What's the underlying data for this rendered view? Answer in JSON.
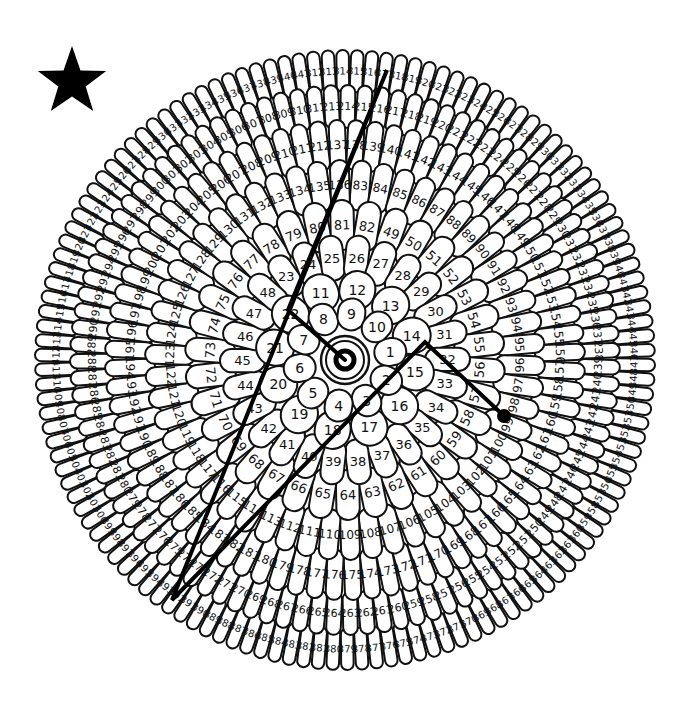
{
  "puzzle": {
    "title": "Numbered flower connect-the-path puzzle",
    "center": {
      "x": 345,
      "y": 360
    },
    "colors": {
      "line": "#000000",
      "outline": "#111111",
      "fill": "#ffffff",
      "background": "#ffffff"
    },
    "star_icon": {
      "x": 72,
      "y": 82,
      "size": 36
    },
    "core": {
      "numbers": [
        1,
        2,
        3,
        4,
        5
      ],
      "outer_ring_r": 24,
      "inner_ring_r": 19,
      "dot_r": 9
    },
    "rings": [
      {
        "r_in": 30,
        "r_out": 62,
        "start": 1,
        "end": 10,
        "numbers": [
          1,
          2,
          3,
          4,
          5,
          6,
          7,
          8,
          9,
          10
        ],
        "font": 14,
        "start_angle": -10
      },
      {
        "r_in": 52,
        "r_out": 90,
        "start": 11,
        "end": 22,
        "numbers": [
          11,
          12,
          13,
          14,
          15,
          16,
          17,
          18,
          19,
          20,
          21,
          22
        ],
        "font": 14,
        "start_angle": -110
      },
      {
        "r_in": 80,
        "r_out": 125,
        "start": 23,
        "end": 48,
        "numbers": [
          23,
          24,
          25,
          26,
          27,
          28,
          29,
          30,
          31,
          32,
          33,
          34,
          35,
          36,
          37,
          38,
          39,
          40,
          41,
          42,
          43,
          44,
          45,
          46,
          47,
          48
        ],
        "font": 13,
        "start_angle": -125
      },
      {
        "r_in": 110,
        "r_out": 160,
        "start": 49,
        "end": 82,
        "numbers": [],
        "font": 13,
        "start_angle": -70
      },
      {
        "r_in": 150,
        "r_out": 200,
        "start": 83,
        "end": 136,
        "numbers": [],
        "font": 12,
        "start_angle": -85
      },
      {
        "r_in": 190,
        "r_out": 240,
        "start": 137,
        "end": 212,
        "numbers": [],
        "font": 12,
        "start_angle": -92
      },
      {
        "r_in": 232,
        "r_out": 275,
        "start": 213,
        "end": 311,
        "numbers": [],
        "font": 11,
        "start_angle": -93
      },
      {
        "r_in": 268,
        "r_out": 310,
        "start": 312,
        "end": 441,
        "numbers": [],
        "font": 10,
        "start_angle": -96
      }
    ],
    "drawn_path": {
      "label": "player-drawn line",
      "points": [
        {
          "x": 345,
          "y": 360,
          "at": "center"
        },
        {
          "x": 288,
          "y": 310,
          "at": "21"
        },
        {
          "x": 387,
          "y": 70,
          "at": "319"
        },
        {
          "x": 172,
          "y": 600,
          "at": "402"
        },
        {
          "x": 425,
          "y": 342,
          "at": "14"
        },
        {
          "x": 504,
          "y": 416,
          "at": "98"
        }
      ],
      "end_dot": {
        "x": 504,
        "y": 416,
        "r": 7
      }
    }
  }
}
